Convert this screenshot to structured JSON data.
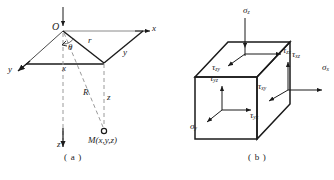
{
  "figure": {
    "panels": [
      {
        "id": "a",
        "caption": "( a )",
        "title": "spatial-coordinate-point",
        "origin_label": "O",
        "axes": [
          {
            "name": "x-axis",
            "label": "x"
          },
          {
            "name": "y-axis",
            "label": "y"
          },
          {
            "name": "z-axis",
            "label": "z"
          }
        ],
        "labels": {
          "angle": "θ",
          "radial": "r",
          "slant": "R",
          "depth": "z",
          "x_edge": "x",
          "y_edge": "y",
          "point": "M(x,y,z)"
        }
      },
      {
        "id": "b",
        "caption": "( b )",
        "title": "stress-element-cube",
        "top_face": {
          "normal": "σ",
          "normal_sub": "z",
          "shear_x": "τ",
          "shear_x_sub": "zx",
          "shear_y": "τ",
          "shear_y_sub": "zy"
        },
        "front_face": {
          "normal": "σ",
          "normal_sub": "y",
          "shear_z": "τ",
          "shear_z_sub": "yz",
          "shear_x": "τ",
          "shear_x_sub": "yx"
        },
        "right_face": {
          "normal": "σ",
          "normal_sub": "x",
          "shear_z": "τ",
          "shear_z_sub": "xz",
          "shear_y": "τ",
          "shear_y_sub": "xy"
        }
      }
    ],
    "colors": {
      "stroke": "#1a1a1a",
      "dashed": "#8c8c8c",
      "thin": "#5a5a5a",
      "background": "#ffffff"
    }
  }
}
